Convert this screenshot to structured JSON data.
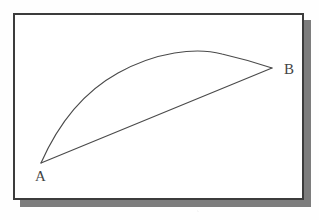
{
  "figure": {
    "background_color": "#ffffff",
    "paper_color": "#fefefe",
    "stroke_color": "#4a4a4a",
    "frame_border_color": "#3c3c3c",
    "frame_shadow_color": "#7d7d7d",
    "label_color": "#444444"
  },
  "frame": {
    "x": 13,
    "y": 13,
    "width": 291,
    "height": 187,
    "border_width": 2,
    "shadow_offset_x": 7,
    "shadow_offset_y": 7
  },
  "points": [
    {
      "id": "A",
      "label": "A",
      "x": 41,
      "y": 163,
      "label_x": 35,
      "label_y": 169,
      "role": "start-point"
    },
    {
      "id": "B",
      "label": "B",
      "x": 272,
      "y": 68,
      "label_x": 284,
      "label_y": 62,
      "role": "end-point"
    }
  ],
  "chart_data": {
    "type": "line",
    "xlabel": "",
    "ylabel": "",
    "grid": false,
    "legend": "none",
    "annotations": [
      {
        "text": "A",
        "x": 41,
        "y": 163
      },
      {
        "text": "B",
        "x": 272,
        "y": 68
      }
    ],
    "series": [
      {
        "name": "arc",
        "description": "Curved path bowing upward from A to B, apex near x=205",
        "x": [
          41,
          52,
          64,
          78,
          95,
          113,
          133,
          155,
          176,
          196,
          212,
          232,
          252,
          272
        ],
        "y": [
          163,
          140,
          120,
          104,
          89,
          78,
          68,
          61,
          55,
          52,
          51,
          54,
          60,
          68
        ]
      },
      {
        "name": "chord",
        "description": "Straight line segment directly from A to B",
        "x": [
          41,
          272
        ],
        "y": [
          163,
          68
        ]
      }
    ],
    "xlim": [
      13,
      304
    ],
    "ylim": [
      200,
      13
    ]
  },
  "paths": {
    "arc_d": "M 41 163 C 56 129, 80 94, 118 73 C 156 52, 196 47, 222 54 C 244 59, 260 64, 272 68",
    "chord_d": "M 41 163 L 272 68"
  }
}
